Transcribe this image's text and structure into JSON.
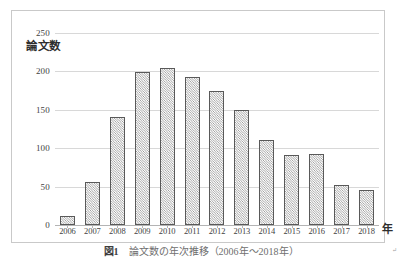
{
  "chart_data": {
    "type": "bar",
    "title": "",
    "xlabel": "年",
    "ylabel": "論文数",
    "categories": [
      "2006",
      "2007",
      "2008",
      "2009",
      "2010",
      "2011",
      "2012",
      "2013",
      "2014",
      "2015",
      "2016",
      "2017",
      "2018"
    ],
    "values": [
      12,
      56,
      140,
      199,
      205,
      193,
      175,
      150,
      111,
      91,
      93,
      52,
      45
    ],
    "ylim": [
      0,
      250
    ],
    "ytick_labels": [
      "0",
      "50",
      "100",
      "150",
      "200",
      "250"
    ],
    "ytick_values": [
      0,
      50,
      100,
      150,
      200,
      250
    ],
    "grid": true,
    "legend": "none",
    "series_name": "論文数",
    "bar_fill": "diagonal-crosshatch",
    "colors": {
      "bar_border": "#595959",
      "bar_hatch": "#8e8e8e",
      "gridline": "#d8d8d8",
      "axis": "#b4b4b4",
      "frame_border": "#c9c9c9",
      "text": "#3f3f3f",
      "background": "#ffffff"
    }
  },
  "axis": {
    "y_title": "論文数",
    "x_unit": "年"
  },
  "caption": {
    "label": "図1",
    "text": "　論文数の年次推移（2006年～2018年）"
  },
  "stray_mark": "↵"
}
